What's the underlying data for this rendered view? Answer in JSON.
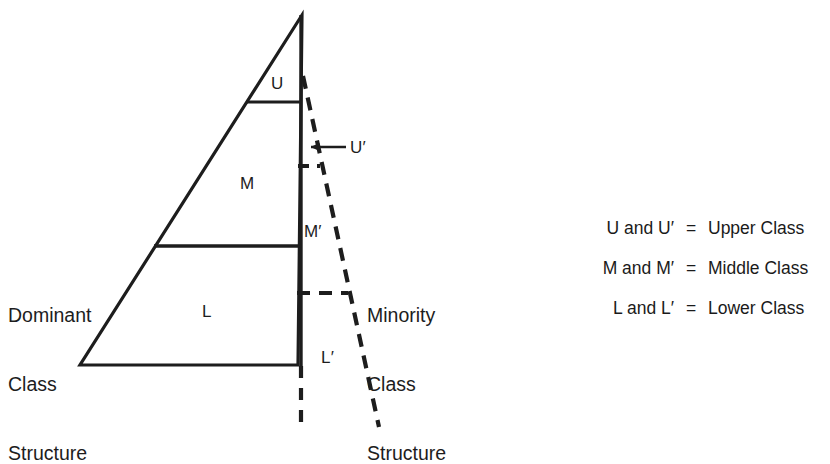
{
  "diagram": {
    "title_left": "Dominant\nClass\nStructure",
    "title_right": "Minority\nClass\nStructure",
    "left_label_lines": [
      "Dominant",
      "Class",
      "Structure"
    ],
    "right_label_lines": [
      "Minority",
      "Class",
      "Structure"
    ],
    "solid_segments": {
      "upper": "U",
      "middle": "M",
      "lower": "L"
    },
    "dashed_segments": {
      "upper": "U′",
      "middle": "M′",
      "lower": "L′"
    },
    "colors": {
      "ink": "#1d1d1d",
      "background": "#ffffff"
    }
  },
  "legend": {
    "rows": [
      {
        "symbols": "U and U′",
        "equals": "=",
        "name": "Upper Class"
      },
      {
        "symbols": "M and M′",
        "equals": "=",
        "name": "Middle Class"
      },
      {
        "symbols": "L and L′",
        "equals": "=",
        "name": "Lower Class"
      }
    ]
  }
}
